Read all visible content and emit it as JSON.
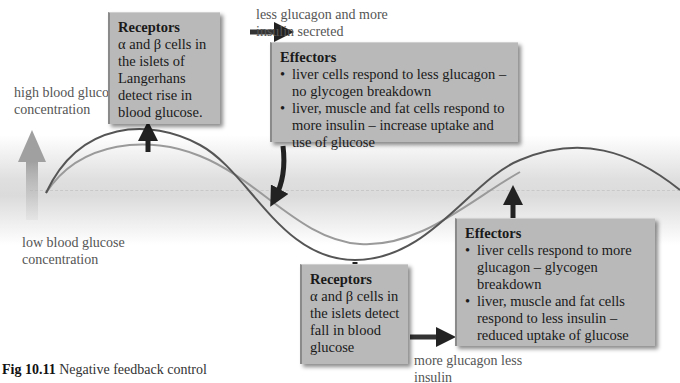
{
  "figure": {
    "caption_number": "Fig 10.11",
    "caption_text": "Negative feedback control"
  },
  "axis_labels": {
    "high": "high blood glucose concentration",
    "low": "low blood glucose concentration"
  },
  "boxes": {
    "receptors_top": {
      "title": "Receptors",
      "body": "α and β cells in the islets of Langerhans detect rise in blood glucose."
    },
    "effectors_top": {
      "title": "Effectors",
      "bullets": [
        "liver cells respond to less glucagon – no glycogen breakdown",
        "liver, muscle and fat cells respond to more insulin – increase uptake and use of glucose"
      ]
    },
    "receptors_bottom": {
      "title": "Receptors",
      "body": "α and β cells in the islets detect fall in blood glucose"
    },
    "effectors_bottom": {
      "title": "Effectors",
      "bullets": [
        "liver cells respond to more glucagon – glycogen breakdown",
        "liver, muscle and fat cells respond to less insulin – reduced uptake of glucose"
      ]
    }
  },
  "arrow_labels": {
    "top": "less glucagon and more insulin secreted",
    "bottom": "more glucagon less insulin"
  },
  "colors": {
    "box_fill": "#b9b9b9",
    "dark_curve": "#555555",
    "light_curve": "#999999",
    "arrow": "#222222",
    "scale_arrow": "#aaaaaa"
  }
}
